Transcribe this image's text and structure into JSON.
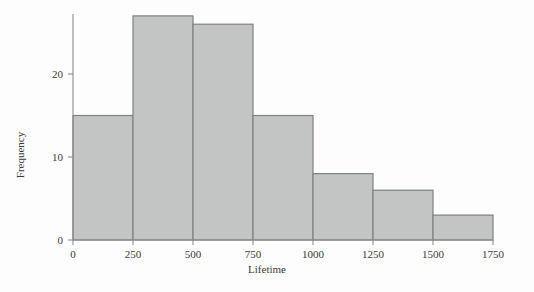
{
  "chart_data": {
    "type": "bar",
    "title": "",
    "subtitle": "",
    "xlabel": "Lifetime",
    "ylabel": "Frequency",
    "categories": [
      "0-250",
      "250-500",
      "500-750",
      "750-1000",
      "1000-1250",
      "1250-1500",
      "1500-1750"
    ],
    "bin_edges": [
      0,
      250,
      500,
      750,
      1000,
      1250,
      1500,
      1750
    ],
    "values": [
      15,
      27,
      26,
      15,
      8,
      6,
      3
    ],
    "xlim": [
      0,
      1750
    ],
    "ylim": [
      0,
      28
    ],
    "xticks": [
      0,
      250,
      500,
      750,
      1000,
      1250,
      1500,
      1750
    ],
    "xtick_labels": [
      "0",
      "250",
      "500",
      "750",
      "1000",
      "1250",
      "1500",
      "1750"
    ],
    "yticks": [
      0,
      10,
      20
    ],
    "ytick_labels": [
      "0",
      "10",
      "20"
    ],
    "grid": false,
    "legend": false,
    "legend_position": "none",
    "bar_fill_color": "#c3c5c5",
    "bar_edge_color": "#7e8181",
    "axis_color": "#8a8c8c",
    "background_color": "#fdfdfd"
  }
}
